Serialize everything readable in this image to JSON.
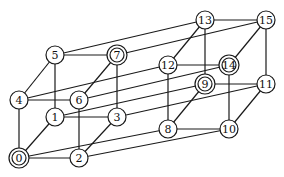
{
  "diagram": {
    "type": "graph",
    "line_color": "#1a1a1a",
    "node_fill": "#ffffff",
    "node_radius": 9,
    "nodes": [
      {
        "id": 0,
        "label": "0",
        "x": 19,
        "y": 158,
        "double": true
      },
      {
        "id": 1,
        "label": "1",
        "x": 55,
        "y": 117,
        "double": false
      },
      {
        "id": 2,
        "label": "2",
        "x": 79,
        "y": 158,
        "double": false
      },
      {
        "id": 3,
        "label": "3",
        "x": 117,
        "y": 117,
        "double": false
      },
      {
        "id": 4,
        "label": "4",
        "x": 19,
        "y": 100,
        "double": false
      },
      {
        "id": 5,
        "label": "5",
        "x": 55,
        "y": 55,
        "double": false
      },
      {
        "id": 6,
        "label": "6",
        "x": 79,
        "y": 100,
        "double": false
      },
      {
        "id": 7,
        "label": "7",
        "x": 117,
        "y": 55,
        "double": true
      },
      {
        "id": 8,
        "label": "8",
        "x": 168,
        "y": 129,
        "double": false
      },
      {
        "id": 9,
        "label": "9",
        "x": 205,
        "y": 84,
        "double": true
      },
      {
        "id": 10,
        "label": "10",
        "x": 229,
        "y": 129,
        "double": false
      },
      {
        "id": 11,
        "label": "11",
        "x": 266,
        "y": 84,
        "double": false
      },
      {
        "id": 12,
        "label": "12",
        "x": 168,
        "y": 65,
        "double": false
      },
      {
        "id": 13,
        "label": "13",
        "x": 205,
        "y": 20,
        "double": false
      },
      {
        "id": 14,
        "label": "14",
        "x": 229,
        "y": 65,
        "double": true
      },
      {
        "id": 15,
        "label": "15",
        "x": 266,
        "y": 20,
        "double": false
      }
    ],
    "edges": [
      [
        0,
        1
      ],
      [
        0,
        2
      ],
      [
        0,
        4
      ],
      [
        1,
        3
      ],
      [
        1,
        5
      ],
      [
        2,
        3
      ],
      [
        2,
        6
      ],
      [
        3,
        7
      ],
      [
        4,
        5
      ],
      [
        4,
        6
      ],
      [
        5,
        7
      ],
      [
        6,
        7
      ],
      [
        8,
        9
      ],
      [
        8,
        10
      ],
      [
        8,
        12
      ],
      [
        9,
        11
      ],
      [
        9,
        13
      ],
      [
        10,
        11
      ],
      [
        10,
        14
      ],
      [
        11,
        15
      ],
      [
        12,
        13
      ],
      [
        12,
        14
      ],
      [
        13,
        15
      ],
      [
        14,
        15
      ],
      [
        0,
        8
      ],
      [
        1,
        9
      ],
      [
        2,
        10
      ],
      [
        3,
        11
      ],
      [
        4,
        12
      ],
      [
        5,
        13
      ],
      [
        6,
        14
      ],
      [
        7,
        15
      ]
    ]
  }
}
